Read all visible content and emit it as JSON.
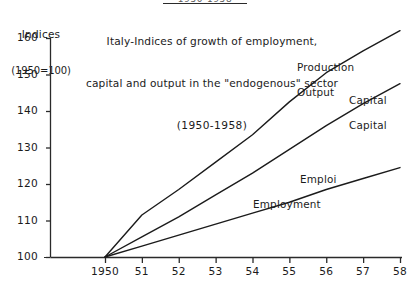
{
  "header": {
    "clipped_top_text": "1950-1958"
  },
  "axis_caption": {
    "line1": "Indices",
    "line2": "(1950=100)"
  },
  "title": {
    "line1": "Italy-Indices of growth of employment,",
    "line2": "capital and output in the \"endogenous\" sector",
    "line3": "(1950-1958)"
  },
  "series_labels": {
    "production": {
      "line1": "Production",
      "line2": "Output"
    },
    "capital": {
      "line1": "Capital",
      "line2": "Capital"
    },
    "employment": {
      "line1": "Emploi",
      "line2": "Employment"
    }
  },
  "style": {
    "line_color": "#1b1b1b",
    "axis_color": "#2a2a2a",
    "background": "#ffffff"
  },
  "chart_data": {
    "type": "line",
    "title": "Italy-Indices of growth of employment, capital and output in the \"endogenous\" sector (1950-1958)",
    "subtitle": "(1950-1958)",
    "xlabel": "",
    "ylabel": "Indices (1950=100)",
    "x": [
      1950,
      1951,
      1952,
      1953,
      1954,
      1955,
      1956,
      1957,
      1958
    ],
    "xtick_labels": [
      "1950",
      "51",
      "52",
      "53",
      "54",
      "55",
      "56",
      "57",
      "58"
    ],
    "ytick_labels": [
      "100",
      "110",
      "120",
      "130",
      "140",
      "150",
      "160"
    ],
    "yticks": [
      100,
      110,
      120,
      130,
      140,
      150,
      160
    ],
    "ylim": [
      100,
      160
    ],
    "xlim": [
      1950,
      1958
    ],
    "grid": false,
    "legend": "inline-annotations",
    "series": [
      {
        "name": "Production Output",
        "label_line1": "Production",
        "label_line2": "Output",
        "values": [
          100,
          111.5,
          118.5,
          126,
          133.5,
          142.5,
          150.5,
          156.5,
          162
        ]
      },
      {
        "name": "Capital",
        "label_line1": "Capital",
        "label_line2": "Capital",
        "values": [
          100,
          105.5,
          111,
          117,
          123,
          129.5,
          136,
          142,
          147.5
        ]
      },
      {
        "name": "Emploi Employment",
        "label_line1": "Emploi",
        "label_line2": "Employment",
        "values": [
          100,
          103,
          106,
          109,
          112,
          115,
          118.5,
          121.5,
          124.5
        ]
      }
    ]
  }
}
